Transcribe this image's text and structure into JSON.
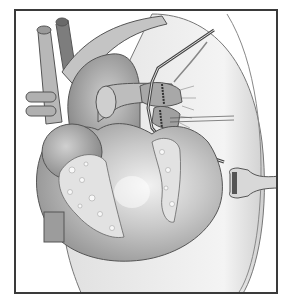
{
  "illustration": {
    "subject": "heart-surgery-anastomosis",
    "style": "grayscale medical illustration",
    "colors": {
      "frame": "#3a3a3a",
      "background": "#ffffff",
      "heart_dark": "#8f8f8f",
      "heart_mid": "#b3b3b3",
      "heart_light": "#d6d6d6",
      "pericardium": "#e4e4e4",
      "fat": "#dcdcdc",
      "outline": "#555555"
    },
    "elements": [
      "aorta",
      "superior-vena-cava",
      "pulmonary-artery",
      "right-ventricle",
      "left-ventricle",
      "pericardium",
      "vascular-clamp",
      "anastomosis-suture",
      "retractor"
    ]
  }
}
